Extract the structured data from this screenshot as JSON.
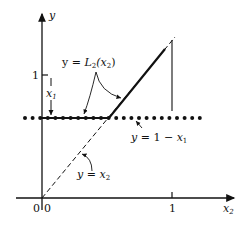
{
  "axes": {
    "x_label": "x",
    "x_label_sub": "2",
    "y_label": "y",
    "origin_x_label": "0",
    "origin_y_label": "0",
    "x_tick_label": "1",
    "y_tick_label": "1"
  },
  "annotations": {
    "x1_marker": "x",
    "x1_marker_sub": "1",
    "L2_label_prefix": "y = ",
    "L2_label_fn": "L",
    "L2_label_fn_sub": "2",
    "L2_label_arg": "(x",
    "L2_label_arg_sub": "2",
    "L2_label_close": ")",
    "dotted_label_prefix": "y = 1 − x",
    "dotted_label_sub": "1",
    "dashed_label_prefix": "y = x",
    "dashed_label_sub": "2"
  },
  "colors": {
    "ink": "#111111",
    "background": "#ffffff"
  }
}
